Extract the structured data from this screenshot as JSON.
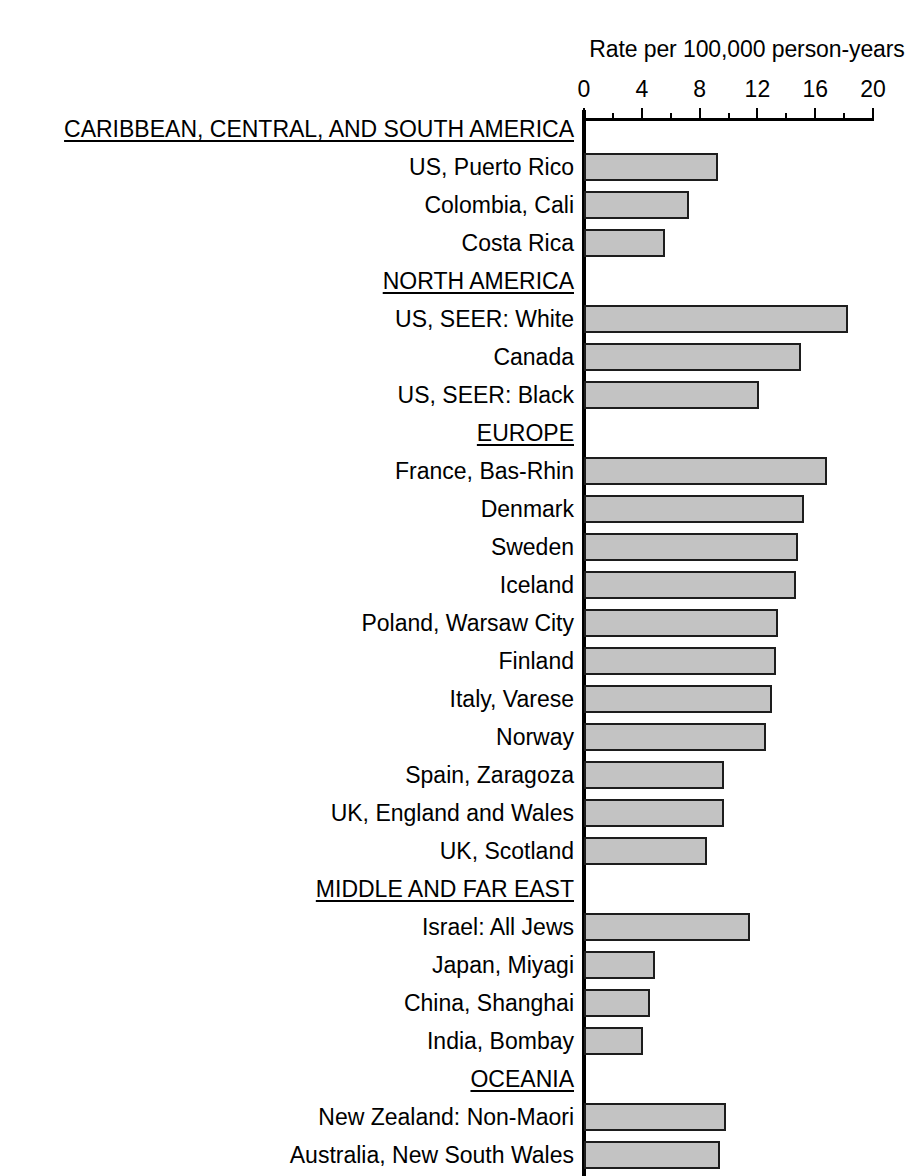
{
  "chart_data": {
    "type": "bar",
    "orientation": "horizontal",
    "title": "Rate per 100,000 person-years",
    "xlabel": "Rate per 100,000 person-years",
    "ylabel": "",
    "xlim": [
      0,
      20
    ],
    "xticks": [
      0,
      4,
      8,
      12,
      16,
      20
    ],
    "xtick_labels": [
      "0",
      "4",
      "8",
      "12",
      "16",
      "20"
    ],
    "minor_tick_interval": 2,
    "grid": false,
    "legend": null,
    "bar_fill_color": "#c3c3c3",
    "bar_border_color": "#1d1d1d",
    "groups": [
      {
        "name": "CARIBBEAN, CENTRAL, AND SOUTH AMERICA",
        "categories": [
          "US, Puerto Rico",
          "Colombia, Cali",
          "Costa Rica"
        ],
        "values": [
          9.3,
          7.3,
          5.6
        ]
      },
      {
        "name": "NORTH AMERICA",
        "categories": [
          "US, SEER: White",
          "Canada",
          "US, SEER: Black"
        ],
        "values": [
          18.3,
          15.0,
          12.1
        ]
      },
      {
        "name": "EUROPE",
        "categories": [
          "France, Bas-Rhin",
          "Denmark",
          "Sweden",
          "Iceland",
          "Poland, Warsaw City",
          "Finland",
          "Italy, Varese",
          "Norway",
          "Spain, Zaragoza",
          "UK, England and Wales",
          "UK, Scotland"
        ],
        "values": [
          16.8,
          15.2,
          14.8,
          14.7,
          13.4,
          13.3,
          13.0,
          12.6,
          9.7,
          9.7,
          8.5
        ]
      },
      {
        "name": "MIDDLE AND FAR EAST",
        "categories": [
          "Israel: All Jews",
          "Japan, Miyagi",
          "China, Shanghai",
          "India, Bombay"
        ],
        "values": [
          11.5,
          4.9,
          4.6,
          4.1
        ]
      },
      {
        "name": "OCEANIA",
        "categories": [
          "New Zealand: Non-Maori",
          "Australia, New South Wales"
        ],
        "values": [
          9.8,
          9.4
        ]
      }
    ],
    "categories": [
      "US, Puerto Rico",
      "Colombia, Cali",
      "Costa Rica",
      "US, SEER: White",
      "Canada",
      "US, SEER: Black",
      "France, Bas-Rhin",
      "Denmark",
      "Sweden",
      "Iceland",
      "Poland, Warsaw City",
      "Finland",
      "Italy, Varese",
      "Norway",
      "Spain, Zaragoza",
      "UK, England and Wales",
      "UK, Scotland",
      "Israel: All Jews",
      "Japan, Miyagi",
      "China, Shanghai",
      "India, Bombay",
      "New Zealand: Non-Maori",
      "Australia, New South Wales"
    ],
    "values": [
      9.3,
      7.3,
      5.6,
      18.3,
      15.0,
      12.1,
      16.8,
      15.2,
      14.8,
      14.7,
      13.4,
      13.3,
      13.0,
      12.6,
      9.7,
      9.7,
      8.5,
      11.5,
      4.9,
      4.6,
      4.1,
      9.8,
      9.4
    ]
  }
}
